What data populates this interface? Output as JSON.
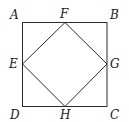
{
  "diagram": {
    "labels": {
      "A": "A",
      "B": "B",
      "C": "C",
      "D": "D",
      "E": "E",
      "F": "F",
      "G": "G",
      "H": "H"
    },
    "points": {
      "A": [
        22,
        22
      ],
      "B": [
        107,
        22
      ],
      "C": [
        107,
        106
      ],
      "D": [
        22,
        106
      ],
      "E": [
        22,
        64
      ],
      "F": [
        65,
        22
      ],
      "G": [
        107,
        64
      ],
      "H": [
        65,
        106
      ]
    },
    "stroke_color": "#2a2a2a"
  }
}
